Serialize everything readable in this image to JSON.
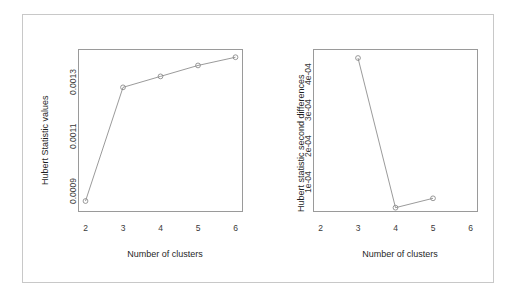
{
  "figure": {
    "background": "#ffffff",
    "frame_color": "#c8c8c8",
    "axis_color": "#9a9a9a",
    "line_color": "#808080",
    "marker_color": "#808080"
  },
  "chart_data": [
    {
      "type": "line",
      "title": "",
      "panel": "left",
      "xlabel": "Number of clusters",
      "ylabel": "Hubert Statistic values",
      "x": [
        2,
        3,
        4,
        5,
        6
      ],
      "values": [
        0.00086,
        0.001275,
        0.001315,
        0.001355,
        0.001385
      ],
      "xticks": [
        "2",
        "3",
        "4",
        "5",
        "6"
      ],
      "xtick_values": [
        2,
        3,
        4,
        5,
        6
      ],
      "yticks": [
        "0.0009",
        "0.0011",
        "0.0013"
      ],
      "ytick_values": [
        0.0009,
        0.0011,
        0.0013
      ],
      "xlim": [
        1.8,
        6.2
      ],
      "ylim": [
        0.00082,
        0.001415
      ],
      "grid": false,
      "legend": null,
      "marker": "open-circle"
    },
    {
      "type": "line",
      "title": "",
      "panel": "right",
      "xlabel": "Number of clusters",
      "ylabel": "Hubert statistic second differences",
      "x": [
        3,
        4,
        5
      ],
      "values": [
        0.000441,
        2.55e-05,
        5.15e-05
      ],
      "xticks": [
        "2",
        "3",
        "4",
        "5",
        "6"
      ],
      "xtick_values": [
        2,
        3,
        4,
        5,
        6
      ],
      "yticks": [
        "1e-04",
        "2e-04",
        "3e-04",
        "4e-04"
      ],
      "ytick_values": [
        0.0001,
        0.0002,
        0.0003,
        0.0004
      ],
      "xlim": [
        1.8,
        6.2
      ],
      "ylim": [
        1.35e-05,
        0.000466
      ],
      "grid": false,
      "legend": null,
      "marker": "open-circle"
    }
  ]
}
